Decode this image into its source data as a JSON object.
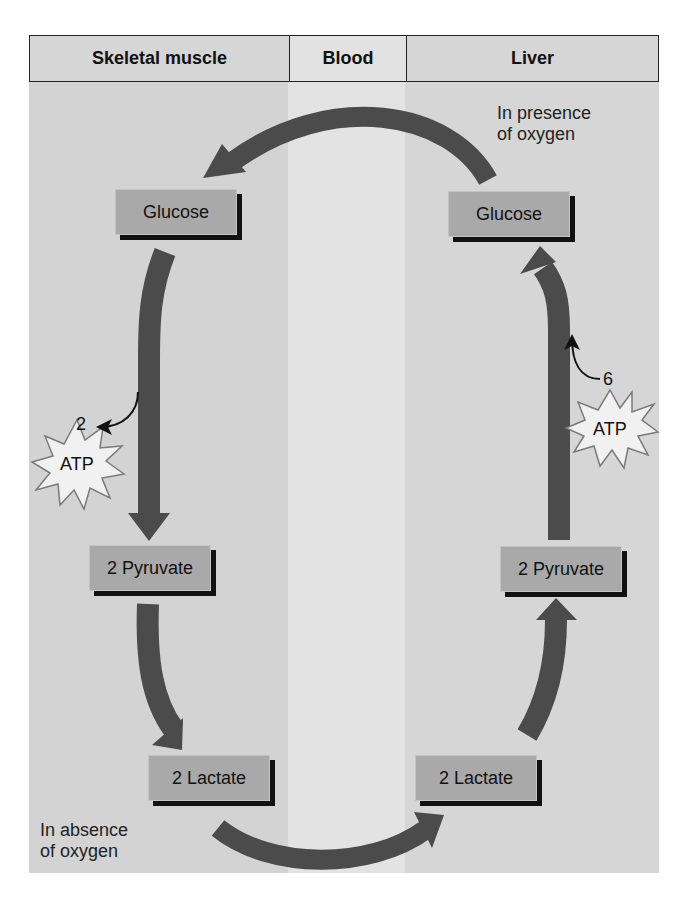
{
  "header": {
    "columns": [
      {
        "label": "Skeletal muscle"
      },
      {
        "label": "Blood"
      },
      {
        "label": "Liver"
      }
    ]
  },
  "muscle": {
    "nodes": {
      "glucose": "Glucose",
      "pyruvate": "2 Pyruvate",
      "lactate": "2 Lactate"
    },
    "atp": {
      "count": "2",
      "label": "ATP"
    },
    "note": [
      "In absence",
      "of oxygen"
    ]
  },
  "liver": {
    "nodes": {
      "glucose": "Glucose",
      "pyruvate": "2 Pyruvate",
      "lactate": "2 Lactate"
    },
    "atp": {
      "count": "6",
      "label": "ATP"
    },
    "note": [
      "In presence",
      "of oxygen"
    ]
  },
  "colors": {
    "arrow": "#4b4b4b",
    "node_fill": "#a9a9a9",
    "muscle_bg": "#d3d3d3",
    "blood_bg": "#e3e3e3",
    "liver_bg": "#d6d6d6"
  }
}
